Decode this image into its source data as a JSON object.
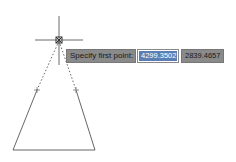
{
  "prompt": {
    "label": "Specify first point:"
  },
  "coords": {
    "x": "4299.3502",
    "y": "2839.4657"
  },
  "colors": {
    "line": "#555555",
    "crosshair": "#6a6a6a",
    "tooltip_bg": "#8a8a8a",
    "highlight": "#5b7fb5"
  }
}
